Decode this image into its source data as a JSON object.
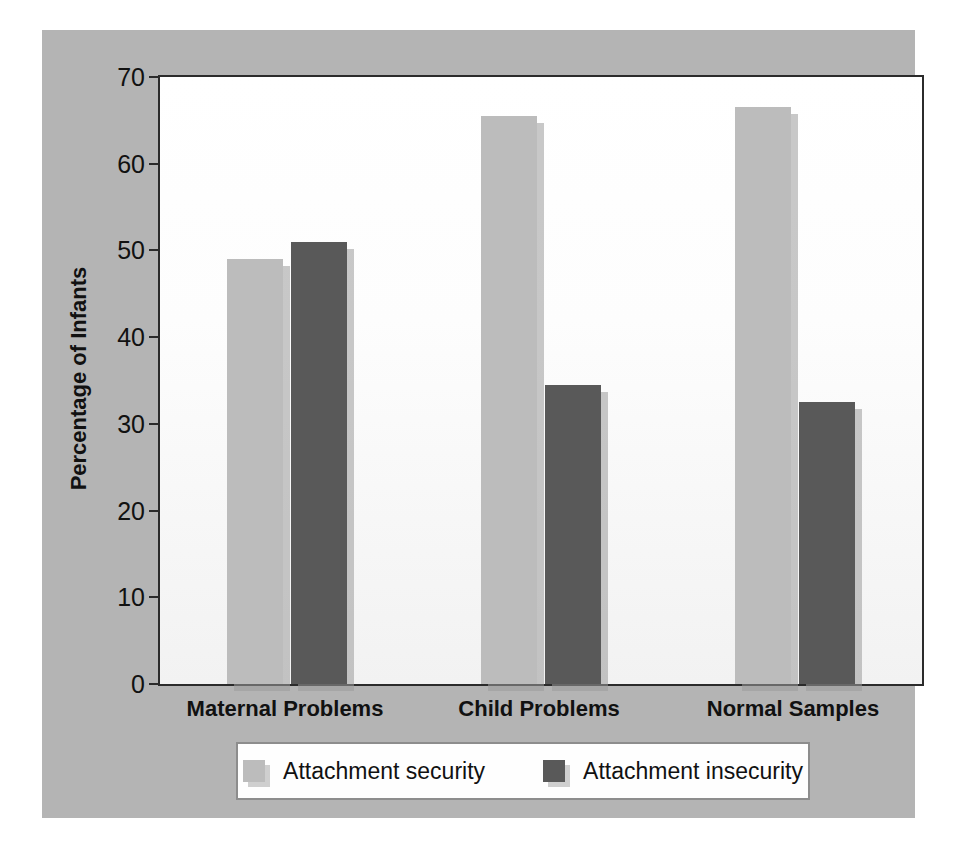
{
  "chart_data": {
    "type": "bar",
    "title": "",
    "xlabel": "",
    "ylabel": "Percentage of Infants",
    "categories": [
      "Maternal Problems",
      "Child Problems",
      "Normal Samples"
    ],
    "series": [
      {
        "name": "Attachment security",
        "color": "#bcbcbc",
        "values": [
          49,
          65.5,
          66.5
        ]
      },
      {
        "name": "Attachment insecurity",
        "color": "#595959",
        "values": [
          51,
          34.5,
          32.5
        ]
      }
    ],
    "ylim": [
      0,
      70
    ],
    "yticks": [
      0,
      10,
      20,
      30,
      40,
      50,
      60,
      70
    ],
    "ytick_labels": [
      "0",
      "10",
      "20",
      "30",
      "40",
      "50",
      "60",
      "70"
    ],
    "grid": false,
    "legend_position": "bottom",
    "legend": [
      {
        "label": "Attachment security",
        "swatch": "#bcbcbc"
      },
      {
        "label": "Attachment insecurity",
        "swatch": "#595959"
      }
    ],
    "colors": {
      "panel_background": "#b4b4b4",
      "plot_background": "#ffffff",
      "axis": "#2b2b2b",
      "bar_light": "#bcbcbc",
      "bar_dark": "#595959",
      "bar_shadow": "#9a9a9a"
    }
  }
}
